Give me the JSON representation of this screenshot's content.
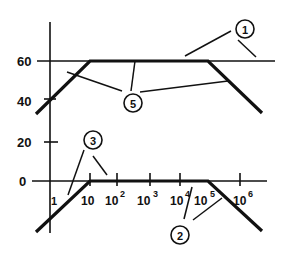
{
  "diagram": {
    "type": "frequency-response-asymptote",
    "y_axis": {
      "ticks": [
        {
          "label": "60",
          "value": 60
        },
        {
          "label": "40",
          "value": 40
        },
        {
          "label": "20",
          "value": 20
        },
        {
          "label": "0",
          "value": 0
        }
      ]
    },
    "x_axis": {
      "scale": "log",
      "ticks": [
        {
          "base": "1",
          "exp": ""
        },
        {
          "base": "10",
          "exp": ""
        },
        {
          "base": "10",
          "exp": "2"
        },
        {
          "base": "10",
          "exp": "3"
        },
        {
          "base": "10",
          "exp": "4"
        },
        {
          "base": "10",
          "exp": "5"
        },
        {
          "base": "10",
          "exp": "6"
        }
      ]
    },
    "callouts": [
      {
        "id": "1",
        "label": "1"
      },
      {
        "id": "2",
        "label": "2"
      },
      {
        "id": "3",
        "label": "3"
      },
      {
        "id": "5",
        "label": "5"
      }
    ],
    "traces": [
      {
        "name": "upper-response",
        "plateau_value": 60,
        "breakpoints": [
          "10",
          "10^5"
        ]
      },
      {
        "name": "lower-response",
        "plateau_value": 0,
        "breakpoints": [
          "10",
          "10^5"
        ]
      }
    ]
  }
}
